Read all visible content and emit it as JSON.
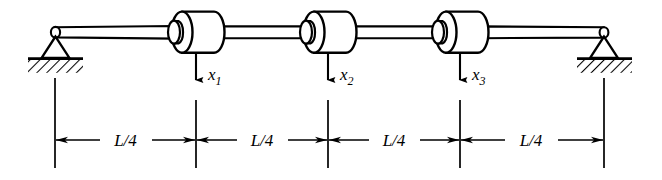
{
  "figure": {
    "stroke_color": "#000000",
    "fill_color": "#ffffff",
    "background": "#ffffff",
    "width": 662,
    "height": 180
  },
  "supports": [
    {
      "name": "left-pin-support",
      "type": "pinned",
      "x": 55,
      "y": 32,
      "label": ""
    },
    {
      "name": "right-pin-support",
      "type": "pinned",
      "x": 604,
      "y": 32,
      "label": ""
    }
  ],
  "shaft": {
    "name": "shaft-rod",
    "x_start": 55,
    "x_end": 604,
    "y_center": 32,
    "thickness": 11
  },
  "masses": [
    {
      "name": "mass-1",
      "cx": 196,
      "x_left": 170,
      "x_right": 222,
      "label": "x",
      "subscript": "1"
    },
    {
      "name": "mass-2",
      "cx": 328,
      "x_left": 302,
      "x_right": 354,
      "label": "x",
      "subscript": "2"
    },
    {
      "name": "mass-3",
      "cx": 460,
      "x_left": 434,
      "x_right": 486,
      "label": "x",
      "subscript": "3"
    }
  ],
  "displacement_arrows": [
    {
      "name": "arrow-x1",
      "x": 196,
      "y_top": 50,
      "y_bottom": 82,
      "label": "x",
      "subscript": "1"
    },
    {
      "name": "arrow-x2",
      "x": 328,
      "y_top": 50,
      "y_bottom": 82,
      "label": "x",
      "subscript": "2"
    },
    {
      "name": "arrow-x3",
      "x": 460,
      "y_top": 50,
      "y_bottom": 82,
      "label": "x",
      "subscript": "3"
    }
  ],
  "dimensions": {
    "line_y": 140,
    "extension_lines": [
      {
        "name": "ext-line-0",
        "x": 55,
        "y_top": 78,
        "y_bottom": 168
      },
      {
        "name": "ext-line-1",
        "x": 196,
        "y_top": 100,
        "y_bottom": 168
      },
      {
        "name": "ext-line-2",
        "x": 328,
        "y_top": 100,
        "y_bottom": 168
      },
      {
        "name": "ext-line-3",
        "x": 460,
        "y_top": 100,
        "y_bottom": 168
      },
      {
        "name": "ext-line-4",
        "x": 604,
        "y_top": 78,
        "y_bottom": 168
      }
    ],
    "segments": [
      {
        "name": "dim-segment-1",
        "x_left": 55,
        "x_right": 196,
        "label": "L/4"
      },
      {
        "name": "dim-segment-2",
        "x_left": 196,
        "x_right": 328,
        "label": "L/4"
      },
      {
        "name": "dim-segment-3",
        "x_left": 328,
        "x_right": 460,
        "label": "L/4"
      },
      {
        "name": "dim-segment-4",
        "x_left": 460,
        "x_right": 604,
        "label": "L/4"
      }
    ]
  }
}
